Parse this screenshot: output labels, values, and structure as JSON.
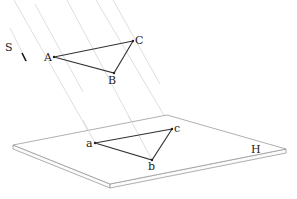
{
  "diagram": {
    "type": "parallel-projection",
    "direction_label": "S",
    "plane_label": "H",
    "object_triangle": {
      "vertices": [
        {
          "label": "A",
          "x": 54,
          "y": 57
        },
        {
          "label": "B",
          "x": 114,
          "y": 73
        },
        {
          "label": "C",
          "x": 133,
          "y": 41
        }
      ]
    },
    "projected_triangle": {
      "vertices": [
        {
          "label": "a",
          "x": 95,
          "y": 143
        },
        {
          "label": "b",
          "x": 152,
          "y": 160
        },
        {
          "label": "c",
          "x": 172,
          "y": 129
        }
      ]
    },
    "plane": {
      "corners": {
        "left": [
          13,
          145
        ],
        "top": [
          167,
          115
        ],
        "right": [
          286,
          149
        ],
        "bottom": [
          110,
          184
        ]
      },
      "thickness": 4
    },
    "colors": {
      "edges": "#333333",
      "projection_lines": "#d6d6d6",
      "plane_outline": "#9a9a9a"
    }
  }
}
